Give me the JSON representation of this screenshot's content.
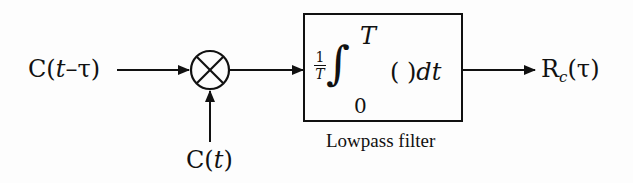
{
  "diagram": {
    "input_delayed": {
      "prefix": "C(",
      "var": "t",
      "suffix": "–τ)"
    },
    "input_ref": {
      "prefix": "C(",
      "var": "t",
      "suffix": ")"
    },
    "mixer_symbol": "×",
    "filter": {
      "frac_num": "1",
      "frac_den": "T",
      "integral": "∫",
      "upper_limit": "T",
      "lower_limit": "0",
      "integrand": "( )",
      "differential": "dt",
      "caption": "Lowpass filter"
    },
    "output": {
      "main": "R",
      "subscript": "c",
      "arg": "(τ)"
    }
  }
}
